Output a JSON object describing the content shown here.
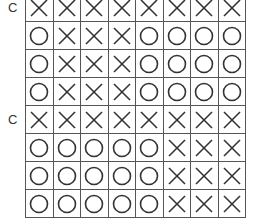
{
  "labels": [
    {
      "text": "C",
      "row": 0
    },
    {
      "text": "C",
      "row": 4
    }
  ],
  "grid": {
    "columns": 8,
    "rows": [
      [
        "X",
        "X",
        "X",
        "X",
        "X",
        "X",
        "X",
        "X"
      ],
      [
        "O",
        "X",
        "X",
        "X",
        "O",
        "O",
        "O",
        "O"
      ],
      [
        "O",
        "X",
        "X",
        "X",
        "O",
        "O",
        "O",
        "O"
      ],
      [
        "O",
        "X",
        "X",
        "X",
        "O",
        "O",
        "O",
        "O"
      ],
      [
        "X",
        "X",
        "X",
        "X",
        "X",
        "X",
        "X",
        "X"
      ],
      [
        "O",
        "O",
        "O",
        "O",
        "O",
        "X",
        "X",
        "X"
      ],
      [
        "O",
        "O",
        "O",
        "O",
        "O",
        "X",
        "X",
        "X"
      ],
      [
        "O",
        "O",
        "O",
        "O",
        "O",
        "X",
        "X",
        "X"
      ]
    ]
  },
  "colors": {
    "line": "#555555",
    "mark": "#333333",
    "background": "#ffffff"
  }
}
